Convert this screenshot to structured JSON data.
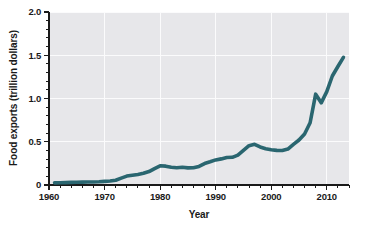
{
  "chart_data": {
    "type": "line",
    "title": "",
    "xlabel": "Year",
    "ylabel": "Food exports (trillion dollars)",
    "xlim": [
      1960,
      2014
    ],
    "ylim": [
      0,
      2.0
    ],
    "grid": true,
    "legend": null,
    "x_ticks": [
      1960,
      1970,
      1980,
      1990,
      2000,
      2010
    ],
    "x_tick_labels": [
      "1960",
      "1970",
      "1980",
      "1990",
      "2000",
      "2010"
    ],
    "x_minor_tick_interval": 2,
    "y_ticks": [
      0,
      0.5,
      1.0,
      1.5,
      2.0
    ],
    "y_tick_labels": [
      "0",
      "0.5",
      "1.0",
      "1.5",
      "2.0"
    ],
    "y_minor_tick_interval": 0.1,
    "line_color": "#2a6670",
    "plot_background_color": "#e7e7ea",
    "gridline_color": "#fbfbfc",
    "figure_background_color": "#ffffff",
    "series": [
      {
        "name": "Food exports",
        "x": [
          1961,
          1962,
          1963,
          1964,
          1965,
          1966,
          1967,
          1968,
          1969,
          1970,
          1971,
          1972,
          1973,
          1974,
          1975,
          1976,
          1977,
          1978,
          1979,
          1980,
          1981,
          1982,
          1983,
          1984,
          1985,
          1986,
          1987,
          1988,
          1989,
          1990,
          1991,
          1992,
          1993,
          1994,
          1995,
          1996,
          1997,
          1998,
          1999,
          2000,
          2001,
          2002,
          2003,
          2004,
          2005,
          2006,
          2007,
          2008,
          2009,
          2010,
          2011,
          2012,
          2013
        ],
        "values": [
          0.025,
          0.026,
          0.028,
          0.03,
          0.031,
          0.033,
          0.034,
          0.035,
          0.037,
          0.042,
          0.046,
          0.055,
          0.08,
          0.103,
          0.113,
          0.122,
          0.135,
          0.155,
          0.19,
          0.222,
          0.218,
          0.205,
          0.2,
          0.205,
          0.198,
          0.199,
          0.215,
          0.248,
          0.268,
          0.29,
          0.302,
          0.318,
          0.32,
          0.345,
          0.4,
          0.455,
          0.47,
          0.44,
          0.42,
          0.408,
          0.4,
          0.398,
          0.415,
          0.47,
          0.52,
          0.59,
          0.72,
          1.05,
          0.95,
          1.08,
          1.26,
          1.37,
          1.475
        ]
      }
    ]
  },
  "axis_labels": {
    "x_title": "Year",
    "y_title": "Food exports (trillion dollars)"
  }
}
